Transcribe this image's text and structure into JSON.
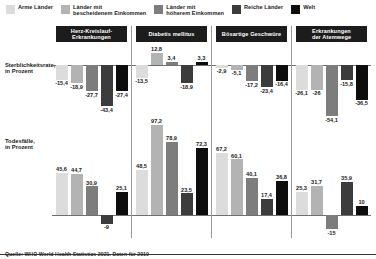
{
  "legend": {
    "items": [
      {
        "label": "Arme Länder",
        "color": "#dcdcdc",
        "icon": "legend-swatch-icon"
      },
      {
        "label": "Länder mit\nbescheidenem Einkommen",
        "color": "#b3b3b3",
        "icon": "legend-swatch-icon"
      },
      {
        "label": "Länder mit\nhöherem Einkommen",
        "color": "#7d7d7d",
        "icon": "legend-swatch-icon"
      },
      {
        "label": "Reiche Länder",
        "color": "#3c3c3c",
        "icon": "legend-swatch-icon"
      },
      {
        "label": "Welt",
        "color": "#0d0d0d",
        "icon": "legend-swatch-icon"
      }
    ]
  },
  "axes": {
    "mortality_title": "Sterblichkeitsrate,",
    "mortality_sub": "in Prozent",
    "deaths_title": "Todesfälle,",
    "deaths_sub": "in Prozent"
  },
  "source": "Quelle: WHO World Health Statistics 2021. Daten für 2019",
  "chart_data": {
    "type": "bar",
    "title": "",
    "subtitle": "",
    "xlabel": "",
    "ylabel": "Prozent",
    "grid": false,
    "legend_position": "top",
    "categories": [
      "Herz-Kreislauf-\nErkrankungen",
      "Diabetis mellitus",
      "Bösartige Geschwüre",
      "Erkrankungen\nder Atemwege"
    ],
    "series": [
      {
        "name": "Arme Länder",
        "color": "#dcdcdc"
      },
      {
        "name": "Länder mit bescheidenem Einkommen",
        "color": "#b3b3b3"
      },
      {
        "name": "Länder mit höherem Einkommen",
        "color": "#7d7d7d"
      },
      {
        "name": "Reiche Länder",
        "color": "#3c3c3c"
      },
      {
        "name": "Welt",
        "color": "#0d0d0d"
      }
    ],
    "panels": [
      {
        "name": "Sterblichkeitsrate, in Prozent",
        "ylim": [
          -60,
          20
        ],
        "groups": [
          {
            "category": "Herz-Kreislauf-Erkrankungen",
            "values": [
              -15.4,
              -18.9,
              -27.7,
              -43.4,
              -27.4
            ],
            "labels": [
              "-15,4",
              "-18,9",
              "-27,7",
              "-43,4",
              "-27,4"
            ]
          },
          {
            "category": "Diabetis mellitus",
            "values": [
              -13.5,
              12.8,
              3.4,
              -18.9,
              3.3
            ],
            "labels": [
              "-13,5",
              "12,8",
              "3,4",
              "-18,9",
              "3,3"
            ]
          },
          {
            "category": "Bösartige Geschwüre",
            "values": [
              -2.9,
              -5.1,
              -17.2,
              -23.4,
              -16.4
            ],
            "labels": [
              "-2,9",
              "-5,1",
              "-17,2",
              "-23,4",
              "-16,4"
            ]
          },
          {
            "category": "Erkrankungen der Atemwege",
            "values": [
              -26.1,
              -26.0,
              -54.1,
              -15.8,
              -36.5
            ],
            "labels": [
              "-26,1",
              "-26",
              "-54,1",
              "-15,8",
              "-36,5"
            ]
          }
        ]
      },
      {
        "name": "Todesfälle, in Prozent",
        "ylim": [
          -20,
          100
        ],
        "groups": [
          {
            "category": "Herz-Kreislauf-Erkrankungen",
            "values": [
              45.6,
              44.7,
              30.9,
              -9.0,
              25.1
            ],
            "labels": [
              "45,6",
              "44,7",
              "30,9",
              "-9",
              "25,1"
            ]
          },
          {
            "category": "Diabetis mellitus",
            "values": [
              48.5,
              97.2,
              78.9,
              23.5,
              72.3
            ],
            "labels": [
              "48,5",
              "97,2",
              "78,9",
              "23,5",
              "72,3"
            ]
          },
          {
            "category": "Bösartige Geschwüre",
            "values": [
              67.2,
              60.1,
              40.1,
              17.4,
              36.8
            ],
            "labels": [
              "67,2",
              "60,1",
              "40,1",
              "17,4",
              "36,8"
            ]
          },
          {
            "category": "Erkrankungen der Atemwege",
            "values": [
              25.3,
              31.7,
              -15.0,
              35.9,
              10.0
            ],
            "labels": [
              "25,3",
              "31,7",
              "-15",
              "35,9",
              "10"
            ]
          }
        ]
      }
    ]
  }
}
